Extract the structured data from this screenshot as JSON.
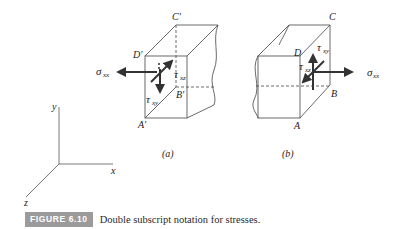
{
  "figure": {
    "number_label": "FIGURE 6.10",
    "caption": "Double subscript notation for stresses.",
    "axes": {
      "x": "x",
      "y": "y",
      "z": "z"
    },
    "subfigure_a": {
      "label": "(a)",
      "vertices": {
        "A": "A′",
        "B": "B′",
        "C": "C′",
        "D": "D′"
      },
      "stresses": {
        "normal": {
          "sym": "σ",
          "sub": "xx"
        },
        "shear_y": {
          "sym": "τ",
          "sub": "xy"
        },
        "shear_z": {
          "sym": "τ",
          "sub": "xz"
        }
      }
    },
    "subfigure_b": {
      "label": "(b)",
      "vertices": {
        "A": "A",
        "B": "B",
        "C": "C",
        "D": "D"
      },
      "stresses": {
        "normal": {
          "sym": "σ",
          "sub": "xx"
        },
        "shear_y": {
          "sym": "τ",
          "sub": "xy"
        },
        "shear_z": {
          "sym": "τ",
          "sub": "xz"
        }
      }
    },
    "colors": {
      "line": "#444444",
      "arrow": "#333333",
      "tag_bg": "#9b9b9b",
      "tag_text": "#ffffff"
    }
  }
}
